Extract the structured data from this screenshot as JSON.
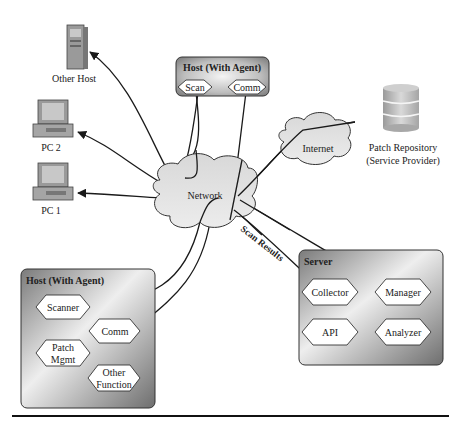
{
  "diagram": {
    "nodes": {
      "other_host": {
        "label": "Other Host"
      },
      "pc2": {
        "label": "PC 2"
      },
      "pc1": {
        "label": "PC 1"
      },
      "network": {
        "label": "Network"
      },
      "internet": {
        "label": "Internet"
      },
      "patch_repository": {
        "label_line1": "Patch Repository",
        "label_line2": "(Service Provider)"
      },
      "host_top": {
        "title": "Host (With Agent)",
        "modules": [
          "Scan",
          "Comm"
        ]
      },
      "host_bottom": {
        "title": "Host (With Agent)",
        "modules": [
          "Scanner",
          "Comm",
          "Patch",
          "Mgmt",
          "Other",
          "Function"
        ]
      },
      "server": {
        "title": "Server",
        "modules": [
          "Collector",
          "Manager",
          "API",
          "Analyzer"
        ]
      }
    },
    "edges": {
      "scan_results_label": "Scan Results"
    },
    "colors": {
      "line": "#1a1a1a",
      "box_dark": "#6e6e6e",
      "box_light": "#f2f2f2",
      "cloud_fill": "#e4e4e4",
      "hex_fill": "#ffffff"
    }
  }
}
